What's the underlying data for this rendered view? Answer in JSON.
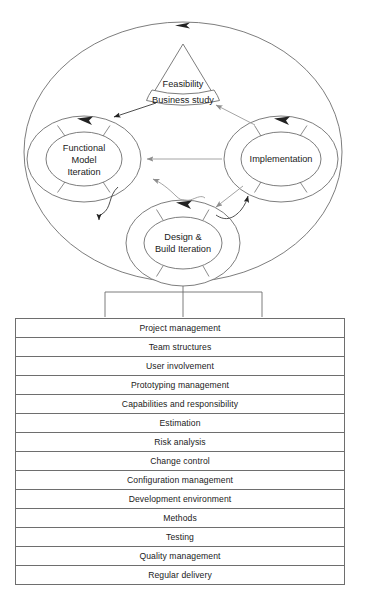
{
  "diagram": {
    "title_visible": false,
    "type": "dsdm-lifecycle",
    "outer_ring": {
      "name": "outer-cycle-ellipse",
      "has_arrowhead_top": true
    },
    "phases": {
      "feasibility": {
        "top_label": "Feasibility",
        "bottom_label": "Business study",
        "shape": "triangle-with-banner"
      },
      "functional_model": {
        "lines": [
          "Functional",
          "Model",
          "Iteration"
        ],
        "shape": "segmented-donut"
      },
      "implementation": {
        "lines": [
          "Implementation"
        ],
        "shape": "segmented-donut"
      },
      "design_build": {
        "lines": [
          "Design &",
          "Build Iteration"
        ],
        "shape": "segmented-donut"
      }
    },
    "connectors": [
      {
        "name": "business-study-to-functional-model",
        "style": "dark-straight-arrow"
      },
      {
        "name": "implementation-to-business-study",
        "style": "gray-straight-arrow"
      },
      {
        "name": "implementation-to-functional-model",
        "style": "gray-horizontal-arrow"
      },
      {
        "name": "design-build-to-functional-model-region",
        "style": "gray-wavy-arrow"
      },
      {
        "name": "functional-model-to-design-build",
        "style": "dark-wavy-arrow"
      },
      {
        "name": "design-build-to-implementation",
        "style": "dark-wavy-arrow"
      },
      {
        "name": "implementation-to-design-build",
        "style": "gray-straight-arrow"
      }
    ],
    "pedestal": {
      "name": "support-pedestal",
      "legs": 3
    }
  },
  "practices_table": {
    "name": "management-practices-table",
    "rows": [
      "Project management",
      "Team structures",
      "User involvement",
      "Prototyping management",
      "Capabilities and responsibility",
      "Estimation",
      "Risk analysis",
      "Change control",
      "Configuration management",
      "Development environment",
      "Methods",
      "Testing",
      "Quality management",
      "Regular delivery"
    ]
  },
  "colors": {
    "stroke_dark": "#3a3a3a",
    "stroke_mid": "#6e6e6e",
    "stroke_light": "#9a9a9a",
    "text": "#1a1a1a",
    "background": "#ffffff"
  }
}
